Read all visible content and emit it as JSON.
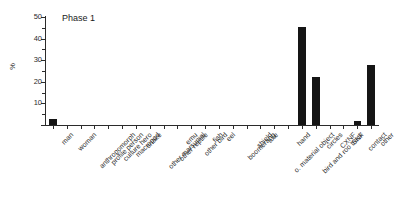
{
  "chart_data": {
    "type": "bar",
    "title": "Phase 1",
    "xlabel": "",
    "ylabel": "%",
    "ylim": [
      0,
      50
    ],
    "yticks": [
      0,
      10,
      20,
      30,
      40,
      50
    ],
    "ytick_labels": [
      "",
      "10",
      "20",
      "30",
      "40",
      "50"
    ],
    "minor_tick_step": 5,
    "grid": false,
    "legend": false,
    "categories": [
      "man",
      "woman",
      "anthropomorph",
      "profile person",
      "culture hero",
      "macropod",
      "snake",
      "other marsupial",
      "other reptile",
      "emu",
      "other bird",
      "fish",
      "eel",
      "boomerang",
      "shield",
      "axe",
      "o. material object",
      "hand",
      "bird and roo track",
      "circles",
      "CXNF",
      "SNF",
      "contact",
      "other"
    ],
    "values": [
      3,
      0,
      0,
      0,
      0,
      0,
      0,
      0,
      0,
      0,
      0,
      0,
      0,
      0,
      0,
      0,
      0,
      0,
      45.5,
      22,
      0,
      0,
      2,
      28
    ],
    "bar_color": "#151515",
    "axis_color": "#2b2b2b",
    "background_color": "#ffffff"
  }
}
